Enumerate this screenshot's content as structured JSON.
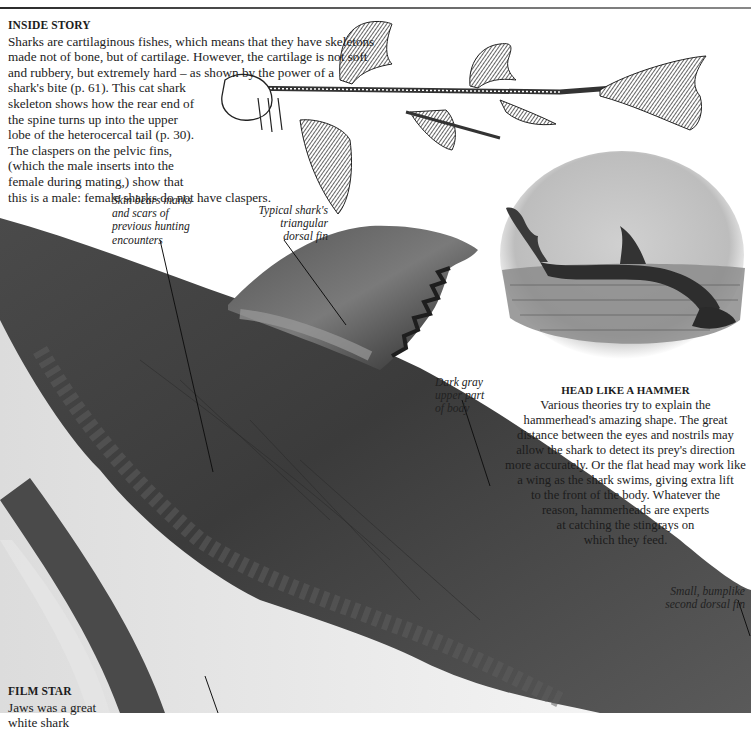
{
  "page": {
    "top_rule": true
  },
  "inside_story": {
    "heading": "INSIDE STORY",
    "lines": [
      "Sharks are cartilaginous fishes, which means that they have skeletons",
      "made not of bone, but of cartilage. However, the cartilage is not soft",
      "and rubbery, but extremely hard – as shown by the power of a",
      "shark's bite (p. 61). This cat shark",
      "skeleton shows how the rear end of",
      "the spine turns up into the upper",
      "lobe of the heterocercal tail (p. 30).",
      "The claspers on the pelvic fins,",
      "(which the male inserts into the",
      "female during mating,)  show that",
      "this is a male: female sharks do not have claspers."
    ]
  },
  "labels": {
    "skin": [
      "Skin bears marks",
      "and scars of",
      "previous hunting",
      "encounters"
    ],
    "dorsal_fin": [
      "Typical shark's",
      "triangular",
      "dorsal fin"
    ],
    "dark_gray": [
      "Dark gray",
      "upper part",
      "of body"
    ],
    "second_fin": [
      "Small, bumplike",
      "second dorsal fin"
    ]
  },
  "head_like_a_hammer": {
    "heading": "HEAD LIKE A HAMMER",
    "lines": [
      "Various theories try to explain the",
      "hammerhead's amazing shape. The great",
      "distance between the eyes and nostrils may",
      "allow the shark to detect its prey's direction",
      "more accurately. Or the flat head may work like",
      "a wing as the shark swims, giving extra lift",
      "to the front of the body. Whatever the",
      "reason, hammerheads are experts",
      "at catching the stingrays on",
      "which they feed."
    ]
  },
  "film_star": {
    "heading": "FILM STAR",
    "lines": [
      "Jaws was a great",
      "white shark"
    ]
  },
  "images": {
    "skeleton": "cat-shark-skeleton-illustration",
    "engraving": "hammerhead-shark-engraving",
    "photo": "great-white-shark-body-photo"
  },
  "colors": {
    "text": "#1c1c1c",
    "shark_dark": "#3a3a3a",
    "shark_mid": "#6b6b6b",
    "belly": "#e8e8e8"
  }
}
